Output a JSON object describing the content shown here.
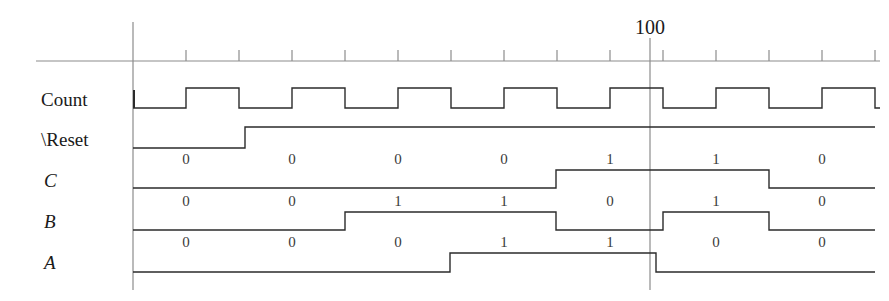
{
  "figure": {
    "type": "digital-timing-diagram",
    "width": 889,
    "height": 301,
    "background_color": "#ffffff",
    "line_color": "#2b2b2b",
    "axis_color": "#8c8c8c",
    "text_color": "#1a1a1a"
  },
  "axis": {
    "name": "time-axis",
    "marker_label": "100",
    "marker_x": 650,
    "origin_x": 133,
    "baseline_y": 61,
    "line_start_x": 36,
    "line_end_x": 880,
    "tick_spacing_px": 53,
    "tick_count": 14,
    "first_tick_x": 186
  },
  "signals": [
    {
      "name": "Count",
      "label": "Count",
      "italic": false,
      "label_x": 41,
      "label_y": 90,
      "top_y": 88,
      "bottom_y": 108,
      "kind": "clock",
      "initial": 0,
      "clock_start_x": 133,
      "clock_period_px": 106,
      "clock_first_rise_x": 186,
      "bits": [],
      "bit_positions": []
    },
    {
      "name": "Reset",
      "label": "\\Reset",
      "italic": false,
      "label_x": 41,
      "label_y": 130,
      "top_y": 127,
      "bottom_y": 148,
      "kind": "level",
      "initial": 0,
      "transitions": [
        245
      ],
      "bits": [],
      "bit_positions": []
    },
    {
      "name": "C",
      "label": "C",
      "italic": true,
      "label_x": 44,
      "label_y": 171,
      "top_y": 170,
      "bottom_y": 188,
      "kind": "level",
      "initial": 0,
      "transitions": [
        556,
        769
      ],
      "bits": [
        "0",
        "0",
        "0",
        "0",
        "1",
        "1",
        "0"
      ],
      "bit_positions": [
        186,
        292,
        398,
        504,
        610,
        716,
        822
      ]
    },
    {
      "name": "B",
      "label": "B",
      "italic": true,
      "label_x": 44,
      "label_y": 212,
      "top_y": 212,
      "bottom_y": 230,
      "kind": "level",
      "initial": 0,
      "transitions": [
        345,
        556,
        663,
        769
      ],
      "bits": [
        "0",
        "0",
        "1",
        "1",
        "0",
        "1",
        "0"
      ],
      "bit_positions": [
        186,
        292,
        398,
        504,
        610,
        716,
        822
      ]
    },
    {
      "name": "A",
      "label": "A",
      "italic": true,
      "label_x": 44,
      "label_y": 253,
      "top_y": 253,
      "bottom_y": 272,
      "kind": "level",
      "initial": 0,
      "transitions": [
        450,
        656
      ],
      "bits": [
        "0",
        "0",
        "0",
        "1",
        "1",
        "0",
        "0"
      ],
      "bit_positions": [
        186,
        292,
        398,
        504,
        610,
        716,
        822
      ]
    }
  ],
  "chart_data": {
    "type": "line",
    "title": "",
    "xlabel": "",
    "ylabel": "",
    "x_marker": "100",
    "series": [
      {
        "name": "Count",
        "description": "free-running clock, 8 full cycles shown",
        "values": [
          0,
          1,
          0,
          1,
          0,
          1,
          0,
          1,
          0,
          1,
          0,
          1,
          0,
          1,
          0,
          1,
          0
        ]
      },
      {
        "name": "\\Reset",
        "description": "active-low reset released early",
        "values": [
          0,
          1,
          1,
          1,
          1,
          1,
          1
        ]
      },
      {
        "name": "C",
        "values": [
          0,
          0,
          0,
          0,
          1,
          1,
          0
        ]
      },
      {
        "name": "B",
        "values": [
          0,
          0,
          1,
          1,
          0,
          1,
          0
        ]
      },
      {
        "name": "A",
        "values": [
          0,
          0,
          0,
          1,
          1,
          0,
          0
        ]
      }
    ]
  }
}
